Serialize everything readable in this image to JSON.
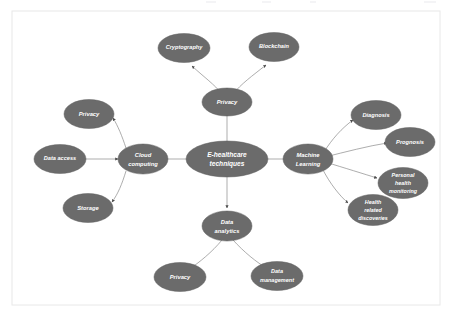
{
  "figure": {
    "type": "concept-map",
    "background_color": "#ffffff",
    "frame_color": "#e8e8e8",
    "node_fill_color": "#6b6b6b",
    "node_text_color": "#ffffff",
    "edge_color": "#8a8a8a"
  },
  "center": {
    "id": "e-healthcare-techniques",
    "label_line1": "E-healthcare",
    "label_line2": "techniques",
    "label": "E-healthcare techniques"
  },
  "branches": {
    "top": {
      "id": "privacy-top",
      "label": "Privacy",
      "children": [
        {
          "id": "cryptography",
          "label": "Cryptography"
        },
        {
          "id": "blockchain",
          "label": "Blockchain"
        }
      ]
    },
    "left": {
      "id": "cloud-computing",
      "label_line1": "Cloud",
      "label_line2": "computing",
      "label": "Cloud computing",
      "children": [
        {
          "id": "privacy-cloud",
          "label": "Privacy"
        },
        {
          "id": "data-access",
          "label": "Data access"
        },
        {
          "id": "storage",
          "label": "Storage"
        }
      ]
    },
    "right": {
      "id": "machine-learning",
      "label_line1": "Machine",
      "label_line2": "Learning",
      "label": "Machine Learning",
      "children": [
        {
          "id": "diagnosis",
          "label": "Diagnosis"
        },
        {
          "id": "prognosis",
          "label": "Prognosis"
        },
        {
          "id": "personal-health-monitoring",
          "label": "Personal health monitoring",
          "label_line1": "Personal",
          "label_line2": "health",
          "label_line3": "monitoring"
        },
        {
          "id": "health-related-discoveries",
          "label": "Health related discoveries",
          "label_line1": "Health",
          "label_line2": "related",
          "label_line3": "discoveries"
        }
      ]
    },
    "bottom": {
      "id": "data-analytics",
      "label_line1": "Data",
      "label_line2": "analytics",
      "label": "Data analytics",
      "children": [
        {
          "id": "privacy-analytics",
          "label": "Privacy"
        },
        {
          "id": "data-management",
          "label": "Data management",
          "label_line1": "Data",
          "label_line2": "management"
        }
      ]
    }
  }
}
